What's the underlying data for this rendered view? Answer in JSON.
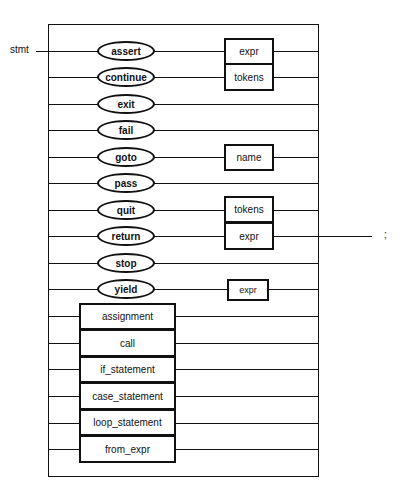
{
  "diagram": {
    "rule_name": "stmt",
    "terminator": ";",
    "keywords": [
      {
        "label": "assert",
        "follow": "expr"
      },
      {
        "label": "continue",
        "follow": "tokens"
      },
      {
        "label": "exit",
        "follow": null
      },
      {
        "label": "fail",
        "follow": null
      },
      {
        "label": "goto",
        "follow": "name"
      },
      {
        "label": "pass",
        "follow": null
      },
      {
        "label": "quit",
        "follow": "tokens"
      },
      {
        "label": "return",
        "follow": "expr"
      },
      {
        "label": "stop",
        "follow": null
      },
      {
        "label": "yield",
        "follow": "expr"
      }
    ],
    "nonterminals": [
      "assignment",
      "call",
      "if_statement",
      "case_statement",
      "loop_statement",
      "from_expr"
    ],
    "colors": {
      "line": "#111111",
      "background": "#ffffff"
    }
  }
}
